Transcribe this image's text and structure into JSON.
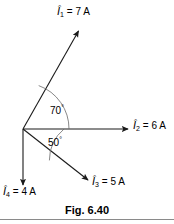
{
  "figure": {
    "caption": "Fig. 6.40",
    "origin": {
      "x": 23,
      "y": 129
    },
    "stroke_color": "#1a1a1a",
    "background": "#ffffff"
  },
  "vectors": [
    {
      "id": "i1",
      "symbol": "Î",
      "subscript": "1",
      "value": "7 A",
      "label": "Î₁ = 7 A",
      "magnitude": 7,
      "unit": "A",
      "angle_deg": 70,
      "tip": {
        "x": 79,
        "y": 29
      }
    },
    {
      "id": "i2",
      "symbol": "Î",
      "subscript": "2",
      "value": "6 A",
      "label": "Î₂ = 6 A",
      "magnitude": 6,
      "unit": "A",
      "angle_deg": 0,
      "tip": {
        "x": 129,
        "y": 129
      }
    },
    {
      "id": "i3",
      "symbol": "Î",
      "subscript": "3",
      "value": "5 A",
      "label": "Î₃ = 5 A",
      "magnitude": 5,
      "unit": "A",
      "angle_deg": -50,
      "tip": {
        "x": 89,
        "y": 181
      }
    },
    {
      "id": "i4",
      "symbol": "Î",
      "subscript": "4",
      "value": "4 A",
      "label": "Î₄ = 4 A",
      "magnitude": 4,
      "unit": "A",
      "angle_deg": -90,
      "tip": {
        "x": 23,
        "y": 186
      }
    }
  ],
  "angles": [
    {
      "id": "a70",
      "text": "70",
      "degree_mark": "°",
      "value": 70,
      "between": [
        "i2",
        "i1"
      ]
    },
    {
      "id": "a50",
      "text": "50",
      "degree_mark": "°",
      "value": 50,
      "between": [
        "i2",
        "i3"
      ]
    }
  ],
  "equals": "="
}
